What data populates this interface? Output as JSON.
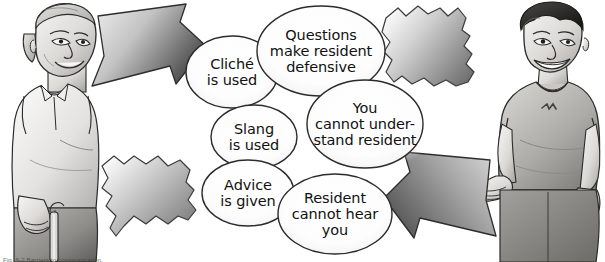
{
  "figure": {
    "background_color": "#ffffff",
    "ink_color": "#111111",
    "shape_fill_light": "#f2f2f2",
    "shape_fill_dark": "#6e6e6e",
    "caption": "Fig. 8-2  Barriers to communication."
  },
  "characters": [
    {
      "name": "resident-elderly-person",
      "position": "left",
      "description": "Elderly resident standing with a cane, smiling, wearing a light collared shirt and dark trousers",
      "alt": "elderly resident with cane"
    },
    {
      "name": "caregiver-young-man",
      "position": "right",
      "description": "Young male caregiver smiling, wearing a short-sleeved t-shirt with a small chest logo and shorts, one hand open in a gesture",
      "alt": "young caregiver gesturing"
    }
  ],
  "arrows": [
    {
      "name": "arrow-resident-to-caregiver",
      "direction": "right",
      "position": "upper-left",
      "fill": "gradient-gray"
    },
    {
      "name": "arrow-caregiver-to-resident",
      "direction": "left",
      "position": "lower-right",
      "fill": "gradient-gray"
    }
  ],
  "blobs": [
    {
      "name": "blob-shape-upper-right",
      "description": "Irregular jagged gray blob (barrier) near the upper right",
      "fill": "gradient-gray"
    },
    {
      "name": "blob-shape-lower-left",
      "description": "Irregular jagged gray blob (barrier) near the lower left",
      "fill": "gradient-gray"
    }
  ],
  "bubbles": [
    {
      "id": "cliche",
      "label": "Cliché\nis used"
    },
    {
      "id": "questions",
      "label": "Questions\nmake resident\ndefensive"
    },
    {
      "id": "you",
      "label": "You\ncannot under-\nstand resident"
    },
    {
      "id": "slang",
      "label": "Slang\nis used"
    },
    {
      "id": "advice",
      "label": "Advice\nis given"
    },
    {
      "id": "resident",
      "label": "Resident\ncannot hear\nyou"
    }
  ]
}
